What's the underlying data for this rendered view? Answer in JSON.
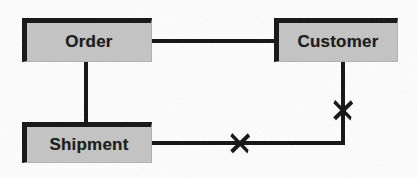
{
  "diagram": {
    "type": "entity-relationship",
    "canvas": {
      "width": 417,
      "height": 178,
      "background": "#fdfdfd"
    },
    "style": {
      "entity_fill": "#c4c4c4",
      "entity_border": "#141414",
      "connector_color": "#131313",
      "label_color": "#171717"
    },
    "entities": [
      {
        "id": "order",
        "label": "Order",
        "x": 22,
        "y": 18,
        "width": 130,
        "height": 44
      },
      {
        "id": "customer",
        "label": "Customer",
        "x": 274,
        "y": 18,
        "width": 124,
        "height": 44
      },
      {
        "id": "shipment",
        "label": "Shipment",
        "x": 22,
        "y": 122,
        "width": 130,
        "height": 41
      }
    ],
    "connectors": [
      {
        "id": "order-customer",
        "from": "order",
        "to": "customer",
        "orientation": "horizontal",
        "x": 152,
        "y": 39,
        "length": 122,
        "crossed": false
      },
      {
        "id": "order-shipment",
        "from": "order",
        "to": "shipment",
        "orientation": "vertical",
        "x": 84,
        "y": 62,
        "length": 60,
        "crossed": false
      },
      {
        "id": "shipment-customer-horizontal",
        "from": "shipment",
        "to": "elbow",
        "orientation": "horizontal",
        "x": 152,
        "y": 141,
        "length": 193,
        "crossed": true
      },
      {
        "id": "shipment-customer-vertical",
        "from": "elbow",
        "to": "customer",
        "orientation": "vertical",
        "x": 341,
        "y": 62,
        "length": 83,
        "crossed": true
      }
    ],
    "cross_marks": [
      {
        "id": "cross-shipment-customer-link",
        "on_connector": "shipment-customer-horizontal",
        "meaning": "relationship-cut",
        "x": 226,
        "y": 129,
        "size": 28
      },
      {
        "id": "cross-customer-shipment-link",
        "on_connector": "shipment-customer-vertical",
        "meaning": "relationship-cut",
        "x": 329,
        "y": 96,
        "size": 28
      }
    ]
  }
}
